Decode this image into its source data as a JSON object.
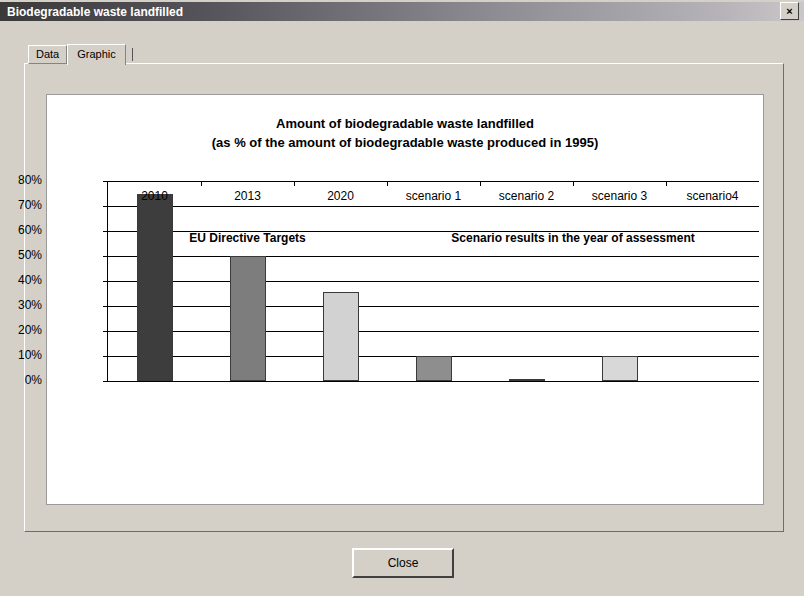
{
  "window": {
    "title": "Biodegradable waste landfilled",
    "close_icon": "close-x-icon",
    "close_glyph": "×"
  },
  "tabs": [
    {
      "label": "Data",
      "active": false
    },
    {
      "label": "Graphic",
      "active": true
    }
  ],
  "footer": {
    "close_label": "Close"
  },
  "chart_data": {
    "type": "bar",
    "title": "Amount of biodegradable waste landfilled",
    "subtitle": "(as % of the amount of biodegradable waste produced in 1995)",
    "xlabel": "",
    "ylabel": "",
    "categories": [
      "2010",
      "2013",
      "2020",
      "scenario 1",
      "scenario 2",
      "scenario 3",
      "scenario4"
    ],
    "values": [
      75,
      50,
      35.5,
      10,
      1,
      10,
      0
    ],
    "bar_colors": [
      "#3d3d3d",
      "#7d7d7d",
      "#d2d2d2",
      "#8e8e8e",
      "#3d3d3d",
      "#d8d8d8",
      "#ffffff"
    ],
    "ylim": [
      0,
      80
    ],
    "ytick_values": [
      0,
      10,
      20,
      30,
      40,
      50,
      60,
      70,
      80
    ],
    "ytick_labels": [
      "0%",
      "10%",
      "20%",
      "30%",
      "40%",
      "50%",
      "60%",
      "70%",
      "80%"
    ],
    "grid": true,
    "legend": "none",
    "group_labels": [
      {
        "text": "EU Directive Targets",
        "spans": [
          "2010",
          "2013",
          "2020"
        ]
      },
      {
        "text": "Scenario results in the year of assessment",
        "spans": [
          "scenario 1",
          "scenario 2",
          "scenario 3",
          "scenario4"
        ]
      }
    ]
  }
}
